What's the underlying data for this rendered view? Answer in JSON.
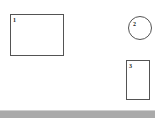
{
  "canvas": {
    "width": 163,
    "height": 122,
    "background_color": "#ffffff"
  },
  "diagram": {
    "stroke_color": "#545454",
    "fill_color": "#ffffff",
    "label_color": "#1a1a1a",
    "shapes": [
      {
        "id": "shape-1",
        "kind": "rectangle",
        "label": "1",
        "x": 10,
        "y": 14,
        "width": 54,
        "height": 42
      },
      {
        "id": "shape-2",
        "kind": "circle",
        "label": "2",
        "x": 128,
        "y": 16,
        "width": 24,
        "height": 24
      },
      {
        "id": "shape-3",
        "kind": "rectangle",
        "label": "3",
        "x": 126,
        "y": 60,
        "width": 24,
        "height": 40
      }
    ]
  },
  "status_bar": {
    "color": "#aaaaaa",
    "highlight_color": "#cfcfcf",
    "x": 0,
    "y": 110,
    "width": 155,
    "height": 8
  }
}
